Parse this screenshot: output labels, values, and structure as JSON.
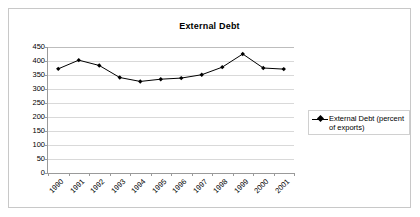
{
  "chart_data": {
    "type": "line",
    "title": "External Debt",
    "xlabel": "",
    "ylabel": "",
    "ylim": [
      0,
      450
    ],
    "ytick_step": 50,
    "yticks": [
      450,
      400,
      350,
      300,
      250,
      200,
      150,
      100,
      50,
      0
    ],
    "grid": true,
    "legend_position": "right",
    "categories": [
      "1990",
      "1991",
      "1992",
      "1993",
      "1994",
      "1995",
      "1996",
      "1997",
      "1998",
      "1999",
      "2000",
      "2001"
    ],
    "series": [
      {
        "name": "External Debt (percent of exports)",
        "values": [
          372,
          403,
          384,
          341,
          327,
          335,
          339,
          351,
          378,
          425,
          375,
          371
        ],
        "color": "#000000",
        "marker": "diamond"
      }
    ]
  },
  "legend": {
    "entries": [
      {
        "label": "External Debt (percent of exports)",
        "marker_name": "legend-marker-diamond"
      }
    ]
  },
  "colors": {
    "series": "#000000",
    "gridline": "#d9d9d9",
    "axis": "#9a9a9a",
    "frame_border": "#c8c8c8",
    "plot_background": "#ffffff"
  }
}
